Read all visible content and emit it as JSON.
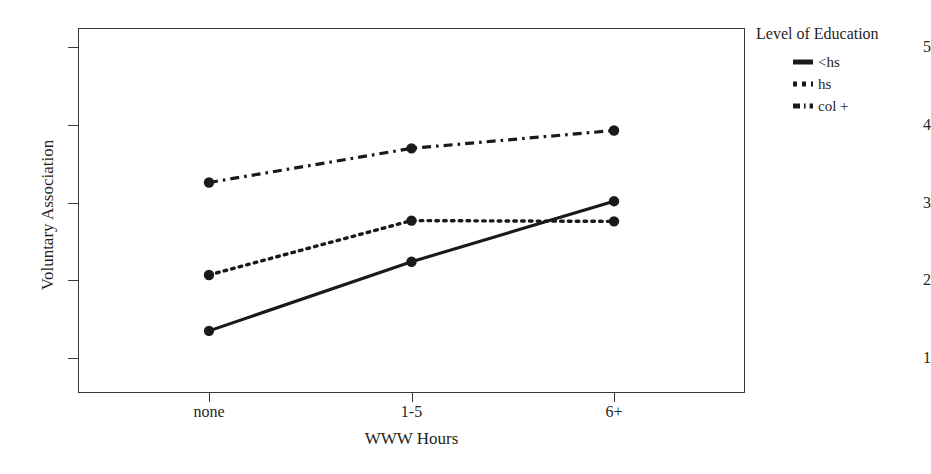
{
  "chart_data": {
    "type": "line",
    "title": "",
    "xlabel": "WWW Hours",
    "ylabel": "Voluntary Association",
    "categories": [
      "none",
      "1-5",
      "6+"
    ],
    "xtick_labels": [
      "none",
      "1-5",
      "6+"
    ],
    "ytick_labels": [
      "1",
      "2",
      "3",
      "4",
      "5"
    ],
    "yticks": [
      1,
      2,
      3,
      4,
      5
    ],
    "ylim": [
      0.55,
      5.25
    ],
    "grid": false,
    "legend_position": "right",
    "legend_title": "Level of Education",
    "markers": "filled-circle",
    "series": [
      {
        "name": "<hs",
        "values": [
          1.35,
          2.24,
          3.02
        ],
        "style": "solid",
        "color": "#1a1a1a"
      },
      {
        "name": "hs",
        "values": [
          2.07,
          2.77,
          2.76
        ],
        "style": "dotted",
        "color": "#1a1a1a"
      },
      {
        "name": "col +",
        "values": [
          3.26,
          3.7,
          3.93
        ],
        "style": "dash-dot",
        "color": "#1a1a1a"
      }
    ]
  },
  "axes": {
    "y_title": "Voluntary Association",
    "x_title": "WWW Hours",
    "y_ticks": [
      {
        "label": "5",
        "value": 5
      },
      {
        "label": "4",
        "value": 4
      },
      {
        "label": "3",
        "value": 3
      },
      {
        "label": "2",
        "value": 2
      },
      {
        "label": "1",
        "value": 1
      }
    ],
    "x_ticks": [
      {
        "label": "none",
        "index": 0
      },
      {
        "label": "1-5",
        "index": 1
      },
      {
        "label": "6+",
        "index": 2
      }
    ]
  },
  "legend": {
    "title": "Level of Education",
    "entries": [
      {
        "label": "<hs",
        "style": "solid"
      },
      {
        "label": "hs",
        "style": "dotted"
      },
      {
        "label": "col +",
        "style": "dash-dot"
      }
    ]
  },
  "colors": {
    "ink": "#1a1a1a",
    "frame": "#3a3a3a",
    "background": "#ffffff"
  }
}
